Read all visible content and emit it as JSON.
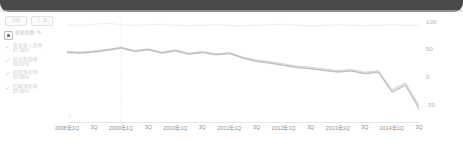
{
  "header": {
    "title": ""
  },
  "toolbar": {
    "buttons": [
      {
        "name": "compare-button",
        "label": "比较"
      },
      {
        "name": "options-button",
        "label": "三 选"
      }
    ]
  },
  "legend": {
    "items": [
      {
        "name": "series-top",
        "label": "原始指数 %",
        "value": "",
        "marker": "checkbox",
        "checked": true,
        "color": "#e3e3e3"
      },
      {
        "name": "series-second",
        "label": "营业收入利率",
        "value": "87.68%",
        "marker": "check",
        "checked": true,
        "color": "#cfcfcf"
      },
      {
        "name": "series-third",
        "label": "营业利润率",
        "value": "60.07%",
        "marker": "check",
        "checked": true,
        "color": "#c9c9c9"
      },
      {
        "name": "series-fourth",
        "label": "利润净利率",
        "value": "50.66%",
        "marker": "check",
        "checked": true,
        "color": "#bdbdbd"
      },
      {
        "name": "series-fifth",
        "label": "归属净利率",
        "value": "56.88%",
        "marker": "check",
        "checked": true,
        "color": "#b6b6b6"
      }
    ]
  },
  "axis_note": "Q",
  "chart_data": {
    "type": "line",
    "title": "",
    "xlabel": "",
    "ylabel": "",
    "ylim": [
      -80,
      110
    ],
    "yticks": [
      100,
      50,
      0,
      -50
    ],
    "grid": false,
    "legend_position": "left",
    "marker_line": {
      "x_category": "2009年1Q",
      "style": "dotted"
    },
    "x": [
      "2008年1Q",
      "2008年2Q",
      "2008年3Q",
      "2008年4Q",
      "2009年1Q",
      "2009年2Q",
      "2009年3Q",
      "2009年4Q",
      "2010年1Q",
      "2010年2Q",
      "2010年3Q",
      "2010年4Q",
      "2011年1Q",
      "2011年2Q",
      "2011年3Q",
      "2011年4Q",
      "2012年1Q",
      "2012年2Q",
      "2012年3Q",
      "2012年4Q",
      "2013年1Q",
      "2013年2Q",
      "2013年3Q",
      "2013年4Q",
      "2014年1Q",
      "2014年2Q",
      "2014年3Q"
    ],
    "xticks": [
      "2008年1Q",
      "3Q",
      "2009年1Q",
      "3Q",
      "2010年1Q",
      "3Q",
      "2011年1Q",
      "3Q",
      "2012年1Q",
      "3Q",
      "2013年1Q",
      "3Q",
      "2014年1Q",
      "3Q"
    ],
    "series": [
      {
        "name": "原始指数 %",
        "color": "#e6e6e6",
        "width": 0.7,
        "values": [
          96,
          95,
          97,
          99,
          96,
          95,
          96,
          97,
          95,
          94,
          95,
          96,
          95,
          94,
          95,
          96,
          97,
          95,
          94,
          95,
          96,
          95,
          94,
          95,
          96,
          95,
          95
        ]
      },
      {
        "name": "营业收入利率",
        "color": "#c8c8c8",
        "width": 0.8,
        "values": [
          48,
          47,
          49,
          52,
          56,
          50,
          53,
          47,
          51,
          45,
          48,
          44,
          46,
          38,
          33,
          30,
          26,
          22,
          20,
          17,
          14,
          16,
          11,
          14,
          -20,
          -8,
          -48
        ]
      },
      {
        "name": "营业利润率",
        "color": "#bdbdbd",
        "width": 0.8,
        "values": [
          47,
          46,
          48,
          51,
          55,
          49,
          52,
          46,
          50,
          44,
          47,
          43,
          45,
          37,
          31,
          28,
          24,
          20,
          18,
          15,
          12,
          14,
          9,
          12,
          -23,
          -11,
          -52
        ]
      },
      {
        "name": "归属净利率",
        "color": "#b2b2b2",
        "width": 0.8,
        "values": [
          46,
          45,
          47,
          50,
          54,
          48,
          51,
          45,
          49,
          43,
          46,
          42,
          44,
          36,
          30,
          27,
          23,
          19,
          17,
          14,
          11,
          13,
          8,
          11,
          -25,
          -13,
          -55
        ]
      }
    ]
  }
}
